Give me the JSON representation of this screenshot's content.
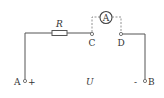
{
  "diagram": {
    "type": "circuit",
    "components": {
      "resistor": {
        "label": "R"
      },
      "ammeter": {
        "label": "A"
      },
      "terminal_c": {
        "label": "C"
      },
      "terminal_d": {
        "label": "D"
      },
      "terminal_a": {
        "label": "A",
        "polarity": "+"
      },
      "terminal_b": {
        "label": "B",
        "polarity": "-"
      },
      "voltage": {
        "label": "U"
      }
    },
    "colors": {
      "wire": "#555555",
      "dashed": "#777777",
      "text": "#333333"
    }
  }
}
